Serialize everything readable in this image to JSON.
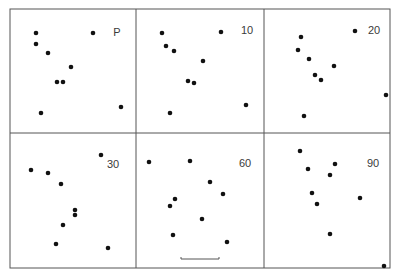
{
  "figure": {
    "colors": {
      "background": "#ffffff",
      "line": "#555555",
      "dot": "#111111",
      "label": "#3a3a3a"
    },
    "frame": {
      "left": 10,
      "top": 9,
      "right": 390,
      "bottom": 268
    },
    "dividers": {
      "vertical": [
        136,
        264
      ],
      "horizontal": [
        133
      ]
    },
    "scale_bar": {
      "x1": 181,
      "x2": 219,
      "y": 259,
      "panel": "60"
    },
    "panels": [
      {
        "label": "P",
        "label_x": 117,
        "label_y": 36,
        "dots": [
          [
            36,
            33
          ],
          [
            36,
            44
          ],
          [
            48,
            53
          ],
          [
            93,
            33
          ],
          [
            71,
            67
          ],
          [
            57,
            82
          ],
          [
            63,
            82
          ],
          [
            41,
            113
          ],
          [
            121,
            107
          ]
        ]
      },
      {
        "label": "10",
        "label_x": 247,
        "label_y": 34,
        "dots": [
          [
            162,
            33
          ],
          [
            166,
            46
          ],
          [
            174,
            51
          ],
          [
            221,
            32
          ],
          [
            203,
            61
          ],
          [
            188,
            81
          ],
          [
            194,
            83
          ],
          [
            170,
            113
          ],
          [
            246,
            105
          ]
        ]
      },
      {
        "label": "20",
        "label_x": 374,
        "label_y": 34,
        "dots": [
          [
            301,
            37
          ],
          [
            298,
            50
          ],
          [
            309,
            59
          ],
          [
            355,
            31
          ],
          [
            334,
            66
          ],
          [
            315,
            75
          ],
          [
            321,
            80
          ],
          [
            304,
            116
          ],
          [
            386,
            95
          ]
        ]
      },
      {
        "label": "30",
        "label_x": 113,
        "label_y": 168,
        "dots": [
          [
            31,
            170
          ],
          [
            48,
            173
          ],
          [
            61,
            184
          ],
          [
            101,
            155
          ],
          [
            75,
            210
          ],
          [
            75,
            215
          ],
          [
            63,
            225
          ],
          [
            56,
            244
          ],
          [
            108,
            248
          ]
        ]
      },
      {
        "label": "60",
        "label_x": 245,
        "label_y": 167,
        "dots": [
          [
            149,
            162
          ],
          [
            190,
            161
          ],
          [
            210,
            182
          ],
          [
            223,
            194
          ],
          [
            175,
            199
          ],
          [
            170,
            206
          ],
          [
            202,
            219
          ],
          [
            173,
            235
          ],
          [
            227,
            242
          ]
        ]
      },
      {
        "label": "90",
        "label_x": 373,
        "label_y": 167,
        "dots": [
          [
            300,
            151
          ],
          [
            308,
            169
          ],
          [
            335,
            164
          ],
          [
            330,
            175
          ],
          [
            312,
            193
          ],
          [
            317,
            204
          ],
          [
            360,
            198
          ],
          [
            330,
            234
          ],
          [
            384,
            266
          ]
        ]
      }
    ]
  }
}
